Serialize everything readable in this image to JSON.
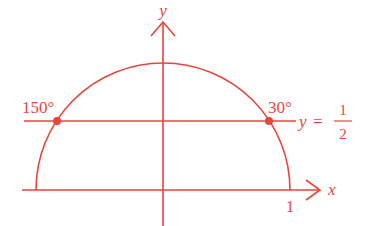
{
  "diagram": {
    "type": "unit-circle-upper-half",
    "color": "#e8453c",
    "axes": {
      "x_label": "x",
      "y_label": "y"
    },
    "tick_labels": {
      "x_one": "1"
    },
    "horizontal_line": {
      "label_var": "y",
      "label_eq": "=",
      "label_num": "1",
      "label_den": "2",
      "value": 0.5
    },
    "points": [
      {
        "name": "point-150",
        "angle_deg": 150,
        "label": "150°"
      },
      {
        "name": "point-30",
        "angle_deg": 30,
        "label": "30°"
      }
    ]
  }
}
